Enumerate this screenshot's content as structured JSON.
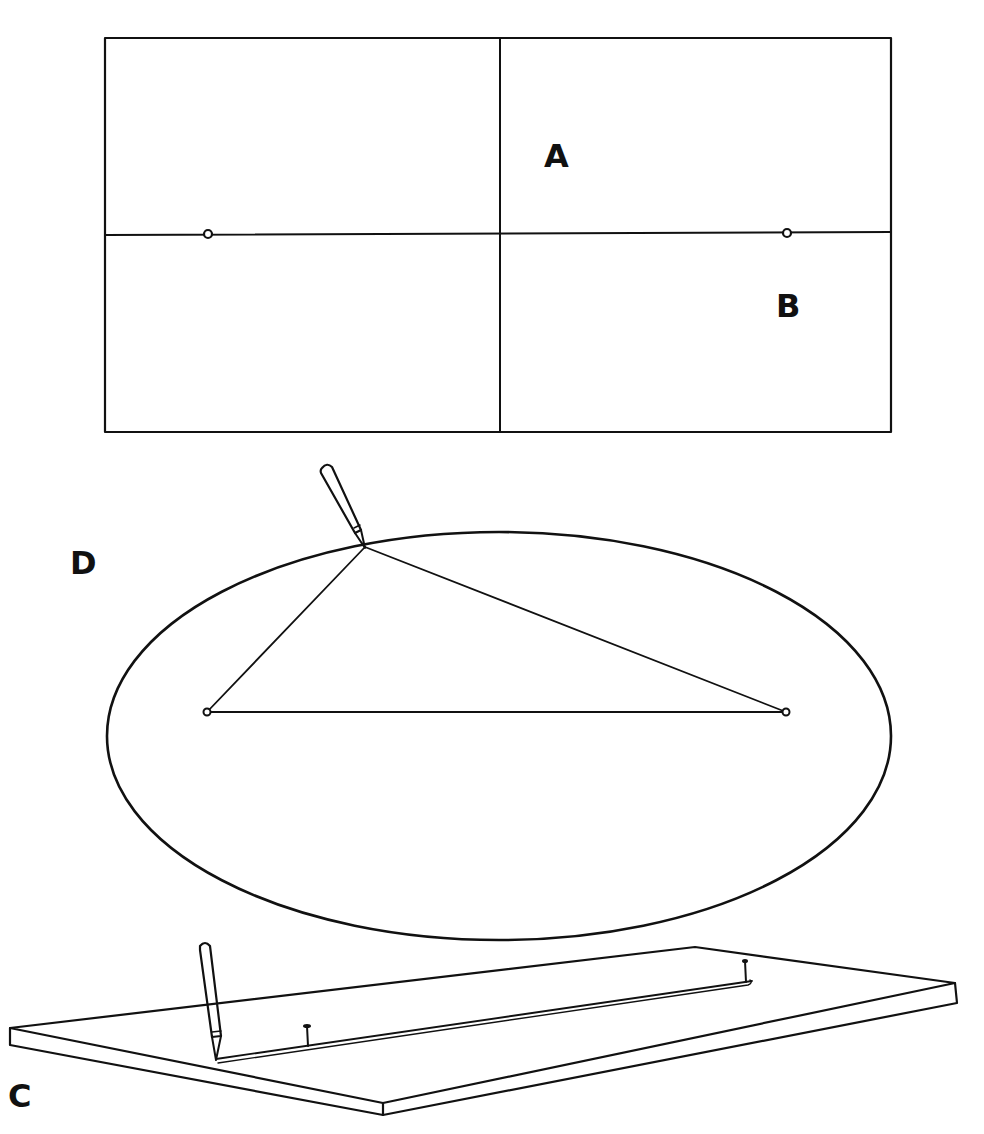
{
  "figure": {
    "panels": [
      {
        "id": "rectangle-panel",
        "description": "Rectangle divided into four quadrants by a vertical and horizontal axis, with two focal pins on the horizontal axis",
        "labels": [
          {
            "text": "A",
            "x": 560,
            "y": 158
          },
          {
            "text": "B",
            "x": 790,
            "y": 308
          }
        ],
        "rect": {
          "x": 105,
          "y": 38,
          "w": 786,
          "h": 394
        },
        "vertical_axis_x": 500,
        "horizontal_axis_y": 234,
        "pins": [
          {
            "x": 208,
            "y": 234
          },
          {
            "x": 787,
            "y": 233
          }
        ]
      },
      {
        "id": "ellipse-panel",
        "labels": [
          {
            "text": "D",
            "x": 82,
            "y": 565
          }
        ],
        "ellipse": {
          "cx": 499,
          "cy": 736,
          "rx": 392,
          "ry": 204
        },
        "foci": [
          {
            "x": 207,
            "y": 712
          },
          {
            "x": 786,
            "y": 712
          }
        ],
        "pencil_point": {
          "x": 364,
          "y": 547
        },
        "description": "String loop around two foci with pencil tracing an ellipse"
      },
      {
        "id": "board-panel",
        "labels": [
          {
            "text": "C",
            "x": 12,
            "y": 1078
          }
        ],
        "description": "Perspective view of a board with two pins, a string and a pencil drawing a straight line"
      }
    ],
    "colors": {
      "ink": "#111111",
      "background": "#ffffff"
    }
  }
}
